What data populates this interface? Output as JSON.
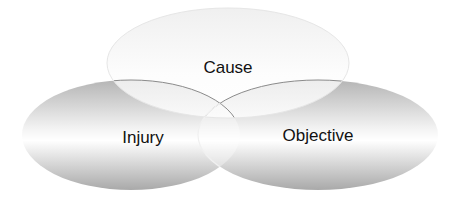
{
  "diagram": {
    "type": "venn",
    "circles": [
      {
        "id": "cause",
        "label": "Cause"
      },
      {
        "id": "injury",
        "label": "Injury"
      },
      {
        "id": "objective",
        "label": "Objective"
      }
    ],
    "colors": {
      "fill_light": "#ffffff",
      "fill_dark": "#a8a8a8",
      "outline": "#808080"
    }
  }
}
